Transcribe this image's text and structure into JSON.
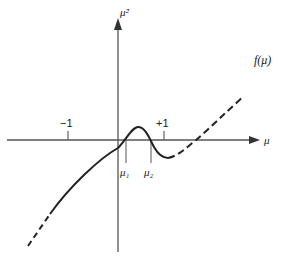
{
  "diagram": {
    "axes": {
      "y_label": "μ̇²",
      "x_label": "μ",
      "tick_minus": "−1",
      "tick_plus": "+1"
    },
    "curve": {
      "label": "f(μ)"
    },
    "markers": {
      "mu1": "μ₁",
      "mu2": "μ₂"
    },
    "colors": {
      "ink": "#222222",
      "axis": "#555555",
      "background": "#ffffff"
    }
  }
}
